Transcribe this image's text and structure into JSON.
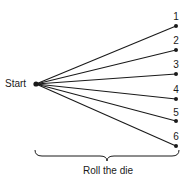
{
  "diagram": {
    "type": "tree",
    "root": {
      "label": "Start"
    },
    "outcomes": [
      {
        "label": "1"
      },
      {
        "label": "2"
      },
      {
        "label": "3"
      },
      {
        "label": "4"
      },
      {
        "label": "5"
      },
      {
        "label": "6"
      }
    ],
    "brace_caption": "Roll the die",
    "colors": {
      "ink": "#1a1a1a",
      "background": "#ffffff"
    }
  }
}
